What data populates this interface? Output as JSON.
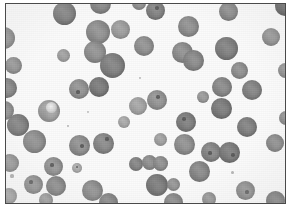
{
  "image": {
    "title": "Blood smear micrograph",
    "kind": "grayscale-micrograph",
    "subject": "rounded cells on pale background",
    "width": 291,
    "height": 212,
    "background_color": "#fbfbfb",
    "paper_color": "#ffffff",
    "border_color": "#4a4a4a",
    "border_width": 1
  },
  "frame": {
    "left": 5,
    "top": 3,
    "width": 281,
    "height": 201
  },
  "palette": {
    "cell_dark": "#6e6e6e",
    "cell_mid": "#8a8a8a",
    "cell_light": "#a6a6a6",
    "cell_pale": "#c2c2c2",
    "nucleus_dot": "#4f4f4f",
    "highlight": "#f2f2f2",
    "rim": "#6a6a6a"
  },
  "counts": {
    "cells_total": 64,
    "clipped_at_edge": 11
  },
  "cells": [
    {
      "id": 1,
      "cx": 64,
      "cy": 13,
      "r": 11.5,
      "tone": "#787878",
      "rim": 0.45,
      "texture": 0.35
    },
    {
      "id": 2,
      "cx": 100,
      "cy": 3,
      "r": 10.5,
      "tone": "#808080",
      "rim": 0.4,
      "texture": 0.3
    },
    {
      "id": 3,
      "cx": 98,
      "cy": 32,
      "r": 12.0,
      "tone": "#8b8b8b",
      "rim": 0.4,
      "texture": 0.4
    },
    {
      "id": 4,
      "cx": 120,
      "cy": 29,
      "r": 9.5,
      "tone": "#9a9a9a",
      "rim": 0.35,
      "texture": 0.3
    },
    {
      "id": 5,
      "cx": 95,
      "cy": 52,
      "r": 11.0,
      "tone": "#8c8c8c",
      "rim": 0.4,
      "texture": 0.35
    },
    {
      "id": 6,
      "cx": 112,
      "cy": 65,
      "r": 12.5,
      "tone": "#7c7c7c",
      "rim": 0.45,
      "texture": 0.35
    },
    {
      "id": 7,
      "cx": 99,
      "cy": 87,
      "r": 10.0,
      "tone": "#757575",
      "rim": 0.45,
      "texture": 0.3
    },
    {
      "id": 8,
      "cx": 79,
      "cy": 89,
      "r": 10.0,
      "tone": "#8d8d8d",
      "rim": 0.4,
      "texture": 0.35,
      "dot": {
        "dx": -1,
        "dy": 3,
        "r": 1.6
      }
    },
    {
      "id": 9,
      "cx": 4,
      "cy": 38,
      "r": 11.0,
      "tone": "#8a8a8a",
      "rim": 0.35,
      "texture": 0.3,
      "clipped": "left"
    },
    {
      "id": 10,
      "cx": 13,
      "cy": 65,
      "r": 8.5,
      "tone": "#8e8e8e",
      "rim": 0.4,
      "texture": 0.3
    },
    {
      "id": 11,
      "cx": 7,
      "cy": 88,
      "r": 10.0,
      "tone": "#7f7f7f",
      "rim": 0.4,
      "texture": 0.35,
      "clipped": "left"
    },
    {
      "id": 12,
      "cx": 4,
      "cy": 110,
      "r": 9.5,
      "tone": "#8b8b8b",
      "rim": 0.35,
      "texture": 0.3,
      "clipped": "left"
    },
    {
      "id": 13,
      "cx": 18,
      "cy": 125,
      "r": 11.0,
      "tone": "#7b7b7b",
      "rim": 0.45,
      "texture": 0.35
    },
    {
      "id": 14,
      "cx": 34,
      "cy": 141,
      "r": 11.5,
      "tone": "#8a8a8a",
      "rim": 0.4,
      "texture": 0.35
    },
    {
      "id": 15,
      "cx": 49,
      "cy": 111,
      "r": 11.0,
      "tone": "#9e9e9e",
      "rim": 0.45,
      "texture": 0.55,
      "highlight": {
        "dx": 2,
        "dy": -4,
        "r": 5.5
      }
    },
    {
      "id": 16,
      "cx": 79,
      "cy": 145,
      "r": 10.5,
      "tone": "#8b8b8b",
      "rim": 0.4,
      "texture": 0.4,
      "dot": {
        "dx": 3,
        "dy": 1,
        "r": 1.8
      }
    },
    {
      "id": 17,
      "cx": 103,
      "cy": 143,
      "r": 10.5,
      "tone": "#848484",
      "rim": 0.4,
      "texture": 0.35,
      "dot": {
        "dx": 4,
        "dy": -4,
        "r": 1.6
      }
    },
    {
      "id": 18,
      "cx": 10,
      "cy": 163,
      "r": 9.0,
      "tone": "#8e8e8e",
      "rim": 0.35,
      "texture": 0.3,
      "clipped": "left"
    },
    {
      "id": 19,
      "cx": 53,
      "cy": 166,
      "r": 9.5,
      "tone": "#8f8f8f",
      "rim": 0.4,
      "texture": 0.4,
      "dot": {
        "dx": -1,
        "dy": -1,
        "r": 1.6
      }
    },
    {
      "id": 20,
      "cx": 33,
      "cy": 184,
      "r": 9.5,
      "tone": "#8a8a8a",
      "rim": 0.4,
      "texture": 0.35,
      "dot": {
        "dx": -2,
        "dy": -2,
        "r": 1.6
      }
    },
    {
      "id": 21,
      "cx": 56,
      "cy": 186,
      "r": 10.0,
      "tone": "#818181",
      "rim": 0.45,
      "texture": 0.35
    },
    {
      "id": 22,
      "cx": 9,
      "cy": 196,
      "r": 8.0,
      "tone": "#969696",
      "rim": 0.35,
      "texture": 0.3,
      "clipped": "left-bottom"
    },
    {
      "id": 23,
      "cx": 92,
      "cy": 190,
      "r": 10.5,
      "tone": "#888888",
      "rim": 0.4,
      "texture": 0.35
    },
    {
      "id": 24,
      "cx": 108,
      "cy": 202,
      "r": 9.5,
      "tone": "#7e7e7e",
      "rim": 0.4,
      "texture": 0.3,
      "clipped": "bottom"
    },
    {
      "id": 25,
      "cx": 77,
      "cy": 168,
      "r": 5.0,
      "tone": "#a8a8a8",
      "rim": 0.35,
      "texture": 0.3,
      "dot": {
        "dx": 0,
        "dy": -1,
        "r": 1.4
      }
    },
    {
      "id": 26,
      "cx": 138,
      "cy": 106,
      "r": 9.0,
      "tone": "#a0a0a0",
      "rim": 0.35,
      "texture": 0.3
    },
    {
      "id": 27,
      "cx": 157,
      "cy": 100,
      "r": 10.0,
      "tone": "#8f8f8f",
      "rim": 0.4,
      "texture": 0.35,
      "dot": {
        "dx": 1,
        "dy": -3,
        "r": 1.8
      }
    },
    {
      "id": 28,
      "cx": 136,
      "cy": 164,
      "r": 7.0,
      "tone": "#7f7f7f",
      "rim": 0.4,
      "texture": 0.3
    },
    {
      "id": 29,
      "cx": 149,
      "cy": 162,
      "r": 7.5,
      "tone": "#888888",
      "rim": 0.4,
      "texture": 0.3
    },
    {
      "id": 30,
      "cx": 160,
      "cy": 163,
      "r": 7.5,
      "tone": "#8a8a8a",
      "rim": 0.4,
      "texture": 0.3
    },
    {
      "id": 31,
      "cx": 157,
      "cy": 185,
      "r": 11.0,
      "tone": "#767676",
      "rim": 0.45,
      "texture": 0.35
    },
    {
      "id": 32,
      "cx": 173,
      "cy": 202,
      "r": 9.5,
      "tone": "#828282",
      "rim": 0.4,
      "texture": 0.3,
      "clipped": "bottom"
    },
    {
      "id": 33,
      "cx": 182,
      "cy": 52,
      "r": 10.5,
      "tone": "#8a8a8a",
      "rim": 0.45,
      "texture": 0.35
    },
    {
      "id": 34,
      "cx": 193,
      "cy": 60,
      "r": 10.5,
      "tone": "#858585",
      "rim": 0.45,
      "texture": 0.35
    },
    {
      "id": 35,
      "cx": 188,
      "cy": 26,
      "r": 10.5,
      "tone": "#8a8a8a",
      "rim": 0.4,
      "texture": 0.35
    },
    {
      "id": 36,
      "cx": 144,
      "cy": 46,
      "r": 10.0,
      "tone": "#8c8c8c",
      "rim": 0.4,
      "texture": 0.35
    },
    {
      "id": 37,
      "cx": 155,
      "cy": 10,
      "r": 9.5,
      "tone": "#7d7d7d",
      "rim": 0.45,
      "texture": 0.3,
      "dot": {
        "dx": 2,
        "dy": -2,
        "r": 1.8
      }
    },
    {
      "id": 38,
      "cx": 228,
      "cy": 11,
      "r": 9.5,
      "tone": "#828282",
      "rim": 0.4,
      "texture": 0.3
    },
    {
      "id": 39,
      "cx": 285,
      "cy": 6,
      "r": 10.0,
      "tone": "#555555",
      "rim": 0.5,
      "texture": 0.3,
      "clipped": "right-top"
    },
    {
      "id": 40,
      "cx": 226,
      "cy": 48,
      "r": 11.5,
      "tone": "#7b7b7b",
      "rim": 0.45,
      "texture": 0.35
    },
    {
      "id": 41,
      "cx": 239,
      "cy": 70,
      "r": 8.5,
      "tone": "#8a8a8a",
      "rim": 0.4,
      "texture": 0.3
    },
    {
      "id": 42,
      "cx": 222,
      "cy": 87,
      "r": 10.0,
      "tone": "#848484",
      "rim": 0.4,
      "texture": 0.35
    },
    {
      "id": 43,
      "cx": 252,
      "cy": 90,
      "r": 10.0,
      "tone": "#7f7f7f",
      "rim": 0.45,
      "texture": 0.3
    },
    {
      "id": 44,
      "cx": 221,
      "cy": 108,
      "r": 10.5,
      "tone": "#767676",
      "rim": 0.45,
      "texture": 0.35
    },
    {
      "id": 45,
      "cx": 247,
      "cy": 127,
      "r": 10.0,
      "tone": "#7c7c7c",
      "rim": 0.45,
      "texture": 0.3
    },
    {
      "id": 46,
      "cx": 275,
      "cy": 143,
      "r": 9.0,
      "tone": "#858585",
      "rim": 0.4,
      "texture": 0.3
    },
    {
      "id": 47,
      "cx": 186,
      "cy": 122,
      "r": 10.0,
      "tone": "#7a7a7a",
      "rim": 0.45,
      "texture": 0.35,
      "dot": {
        "dx": -2,
        "dy": -3,
        "r": 1.8
      }
    },
    {
      "id": 48,
      "cx": 184,
      "cy": 144,
      "r": 10.5,
      "tone": "#8b8b8b",
      "rim": 0.4,
      "texture": 0.35
    },
    {
      "id": 49,
      "cx": 211,
      "cy": 152,
      "r": 10.0,
      "tone": "#818181",
      "rim": 0.4,
      "texture": 0.35,
      "dot": {
        "dx": -1,
        "dy": 1,
        "r": 1.6
      }
    },
    {
      "id": 50,
      "cx": 229,
      "cy": 152,
      "r": 10.5,
      "tone": "#787878",
      "rim": 0.45,
      "texture": 0.35,
      "dot": {
        "dx": 4,
        "dy": 3,
        "r": 1.8
      }
    },
    {
      "id": 51,
      "cx": 199,
      "cy": 171,
      "r": 10.5,
      "tone": "#838383",
      "rim": 0.4,
      "texture": 0.35
    },
    {
      "id": 52,
      "cx": 245,
      "cy": 190,
      "r": 9.5,
      "tone": "#888888",
      "rim": 0.4,
      "texture": 0.35,
      "dot": {
        "dx": 2,
        "dy": 2,
        "r": 1.6
      }
    },
    {
      "id": 53,
      "cx": 275,
      "cy": 200,
      "r": 9.5,
      "tone": "#6f6f6f",
      "rim": 0.45,
      "texture": 0.3,
      "clipped": "bottom"
    },
    {
      "id": 54,
      "cx": 160,
      "cy": 139,
      "r": 6.5,
      "tone": "#9d9d9d",
      "rim": 0.35,
      "texture": 0.3
    },
    {
      "id": 55,
      "cx": 173,
      "cy": 184,
      "r": 6.5,
      "tone": "#8f8f8f",
      "rim": 0.35,
      "texture": 0.3
    },
    {
      "id": 56,
      "cx": 139,
      "cy": 3,
      "r": 7.0,
      "tone": "#8b8b8b",
      "rim": 0.35,
      "texture": 0.3,
      "clipped": "top"
    },
    {
      "id": 57,
      "cx": 203,
      "cy": 97,
      "r": 6.0,
      "tone": "#949494",
      "rim": 0.35,
      "texture": 0.3
    },
    {
      "id": 58,
      "cx": 271,
      "cy": 37,
      "r": 9.0,
      "tone": "#8b8b8b",
      "rim": 0.4,
      "texture": 0.3
    },
    {
      "id": 59,
      "cx": 285,
      "cy": 70,
      "r": 7.5,
      "tone": "#8d8d8d",
      "rim": 0.35,
      "texture": 0.3,
      "clipped": "right"
    },
    {
      "id": 60,
      "cx": 124,
      "cy": 122,
      "r": 6.0,
      "tone": "#a4a4a4",
      "rim": 0.3,
      "texture": 0.25
    },
    {
      "id": 61,
      "cx": 63,
      "cy": 55,
      "r": 6.5,
      "tone": "#9c9c9c",
      "rim": 0.3,
      "texture": 0.25
    },
    {
      "id": 62,
      "cx": 286,
      "cy": 118,
      "r": 7.0,
      "tone": "#8a8a8a",
      "rim": 0.35,
      "texture": 0.3,
      "clipped": "right"
    },
    {
      "id": 63,
      "cx": 46,
      "cy": 200,
      "r": 7.0,
      "tone": "#909090",
      "rim": 0.35,
      "texture": 0.3,
      "clipped": "bottom"
    },
    {
      "id": 64,
      "cx": 209,
      "cy": 199,
      "r": 7.0,
      "tone": "#8d8d8d",
      "rim": 0.35,
      "texture": 0.3,
      "clipped": "bottom"
    }
  ],
  "debris": [
    {
      "cx": 12,
      "cy": 176,
      "r": 1.6,
      "tone": "#9a9a9a"
    },
    {
      "cx": 68,
      "cy": 126,
      "r": 1.4,
      "tone": "#a4a4a4"
    },
    {
      "cx": 140,
      "cy": 78,
      "r": 1.3,
      "tone": "#aaaaaa"
    },
    {
      "cx": 232,
      "cy": 172,
      "r": 1.5,
      "tone": "#a0a0a0"
    },
    {
      "cx": 88,
      "cy": 112,
      "r": 1.2,
      "tone": "#b0b0b0"
    }
  ]
}
